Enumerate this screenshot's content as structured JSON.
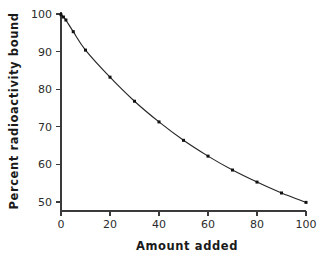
{
  "chart_data": {
    "type": "line",
    "title": "",
    "subtitle": "",
    "xlabel": "Amount added",
    "ylabel": "Percent radioactivity bound",
    "xlim": [
      0,
      100
    ],
    "ylim": [
      50,
      100
    ],
    "xticks": [
      0,
      20,
      40,
      60,
      80,
      100
    ],
    "yticks": [
      50,
      60,
      70,
      80,
      90,
      100
    ],
    "xtick_labels": [
      "0",
      "20",
      "40",
      "60",
      "80",
      "100"
    ],
    "ytick_labels": [
      "50",
      "60",
      "70",
      "80",
      "90",
      "100"
    ],
    "grid": false,
    "legend": false,
    "legend_position": "none",
    "marker": "square",
    "marker_color": "#111111",
    "line_color": "#262626",
    "x": [
      0,
      1,
      2,
      5,
      10,
      20,
      30,
      40,
      50,
      60,
      70,
      80,
      90,
      100
    ],
    "values": [
      99.8,
      99.2,
      98.4,
      95.3,
      90.4,
      83.2,
      76.8,
      71.3,
      66.4,
      62.2,
      58.5,
      55.3,
      52.4,
      49.9
    ],
    "series": [
      {
        "name": "Percent radioactivity bound",
        "x": [
          0,
          1,
          2,
          5,
          10,
          20,
          30,
          40,
          50,
          60,
          70,
          80,
          90,
          100
        ],
        "values": [
          99.8,
          99.2,
          98.4,
          95.3,
          90.4,
          83.2,
          76.8,
          71.3,
          66.4,
          62.2,
          58.5,
          55.3,
          52.4,
          49.9
        ]
      }
    ],
    "annotations": []
  },
  "axes": {
    "x_title": "Amount added",
    "y_title": "Percent radioactivity bound"
  }
}
